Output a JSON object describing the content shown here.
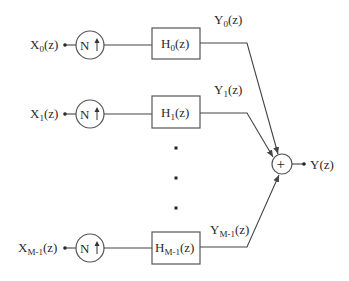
{
  "diagram": {
    "type": "synthesis filter bank block diagram",
    "branches": [
      {
        "input": {
          "main": "X",
          "sub": "0",
          "tail": "(z)"
        },
        "upsampler": {
          "symbol": "N",
          "arrow": "↑"
        },
        "filter": {
          "main": "H",
          "sub": "0",
          "tail": "(z)"
        },
        "output": {
          "main": "Y",
          "sub": "0",
          "tail": "(z)"
        }
      },
      {
        "input": {
          "main": "X",
          "sub": "1",
          "tail": "(z)"
        },
        "upsampler": {
          "symbol": "N",
          "arrow": "↑"
        },
        "filter": {
          "main": "H",
          "sub": "1",
          "tail": "(z)"
        },
        "output": {
          "main": "Y",
          "sub": "1",
          "tail": "(z)"
        }
      },
      {
        "input": {
          "main": "X",
          "sub": "M-1",
          "tail": "(z)"
        },
        "upsampler": {
          "symbol": "N",
          "arrow": "↑"
        },
        "filter": {
          "main": "H",
          "sub": "M-1",
          "tail": "(z)"
        },
        "output": {
          "main": "Y",
          "sub": "M-1",
          "tail": "(z)"
        }
      }
    ],
    "ellipsis": "vertical dots",
    "summer": {
      "symbol": "+"
    },
    "final_output": "Y(z)"
  }
}
